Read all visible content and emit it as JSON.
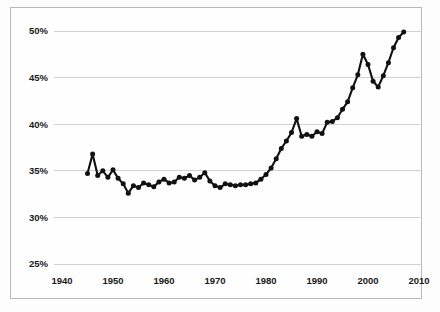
{
  "chart_data": {
    "type": "line",
    "title": "",
    "subtitle": "",
    "xlabel": "",
    "ylabel": "",
    "xlim": [
      1940,
      2010
    ],
    "ylim": [
      25,
      50
    ],
    "grid": true,
    "legend": false,
    "y_ticks": [
      "25%",
      "30%",
      "35%",
      "40%",
      "45%",
      "50%"
    ],
    "y_tick_values": [
      25,
      30,
      35,
      40,
      45,
      50
    ],
    "x_ticks": [
      "1940",
      "1950",
      "1960",
      "1970",
      "1980",
      "1990",
      "2000",
      "2010"
    ],
    "x_tick_values": [
      1940,
      1950,
      1960,
      1970,
      1980,
      1990,
      2000,
      2010
    ],
    "series": [
      {
        "name": "share",
        "marker": "circle",
        "color": "#111111",
        "x": [
          1945,
          1946,
          1947,
          1948,
          1949,
          1950,
          1951,
          1952,
          1953,
          1954,
          1955,
          1956,
          1957,
          1958,
          1959,
          1960,
          1961,
          1962,
          1963,
          1964,
          1965,
          1966,
          1967,
          1968,
          1969,
          1970,
          1971,
          1972,
          1973,
          1974,
          1975,
          1976,
          1977,
          1978,
          1979,
          1980,
          1981,
          1982,
          1983,
          1984,
          1985,
          1986,
          1987,
          1988,
          1989,
          1990,
          1991,
          1992,
          1993,
          1994,
          1995,
          1996,
          1997,
          1998,
          1999,
          2000,
          2001,
          2002,
          2003,
          2004,
          2005,
          2006,
          2007
        ],
        "values": [
          34.7,
          36.8,
          34.5,
          35.0,
          34.3,
          35.1,
          34.2,
          33.6,
          32.6,
          33.4,
          33.2,
          33.7,
          33.5,
          33.3,
          33.8,
          34.1,
          33.7,
          33.8,
          34.3,
          34.2,
          34.5,
          34.0,
          34.3,
          34.8,
          33.9,
          33.4,
          33.2,
          33.6,
          33.5,
          33.4,
          33.5,
          33.5,
          33.6,
          33.7,
          34.1,
          34.6,
          35.3,
          36.3,
          37.4,
          38.2,
          39.1,
          40.6,
          38.7,
          38.9,
          38.7,
          39.2,
          39.0,
          40.2,
          40.3,
          40.7,
          41.6,
          42.4,
          43.9,
          45.3,
          47.5,
          46.4,
          44.6,
          44.0,
          45.2,
          46.6,
          48.2,
          49.3,
          49.9
        ]
      }
    ]
  }
}
